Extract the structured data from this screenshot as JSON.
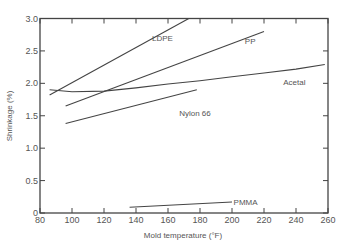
{
  "chart_data": {
    "type": "line",
    "title": "",
    "xlabel": "Mold temperature (°F)",
    "ylabel": "Shrinkage (%)",
    "xlim": [
      80,
      260
    ],
    "ylim": [
      0,
      3.0
    ],
    "xticks": [
      80,
      100,
      120,
      140,
      160,
      180,
      200,
      220,
      240,
      260
    ],
    "yticks": [
      0,
      0.5,
      1.0,
      1.5,
      2.0,
      2.5,
      3.0
    ],
    "ytick_labels": [
      "0",
      "0.5",
      "1.0",
      "1.5",
      "2.0",
      "2.5",
      "3.0"
    ],
    "grid": false,
    "legend": "inline labels",
    "series": [
      {
        "name": "LDPE",
        "x": [
          86,
          173
        ],
        "y": [
          1.82,
          3.0
        ],
        "label_pos": [
          150,
          2.7
        ]
      },
      {
        "name": "PP",
        "x": [
          96,
          220
        ],
        "y": [
          1.65,
          2.8
        ],
        "label_pos": [
          208,
          2.65
        ]
      },
      {
        "name": "Acetal",
        "x": [
          86,
          100,
          120,
          140,
          160,
          180,
          200,
          220,
          240,
          258
        ],
        "y": [
          1.9,
          1.87,
          1.88,
          1.93,
          1.99,
          2.04,
          2.1,
          2.16,
          2.22,
          2.29
        ],
        "label_pos": [
          232,
          2.02
        ]
      },
      {
        "name": "Nylon 66",
        "x": [
          96,
          178
        ],
        "y": [
          1.38,
          1.9
        ],
        "label_pos": [
          167,
          1.54
        ]
      },
      {
        "name": "PMMA",
        "x": [
          136,
          200
        ],
        "y": [
          0.09,
          0.17
        ],
        "label_pos": [
          201,
          0.17
        ]
      }
    ]
  }
}
